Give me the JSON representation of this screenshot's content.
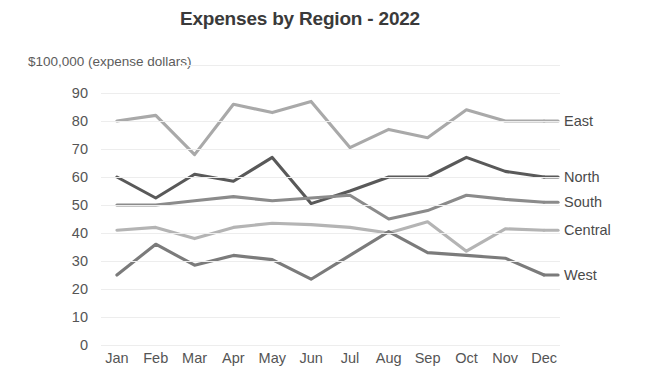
{
  "chart_data": {
    "type": "line",
    "title": "Expenses by Region - 2022",
    "ylabel": "$100,000 (expense dollars)",
    "xlabel": "",
    "categories": [
      "Jan",
      "Feb",
      "Mar",
      "Apr",
      "May",
      "Jun",
      "Jul",
      "Aug",
      "Sep",
      "Oct",
      "Nov",
      "Dec"
    ],
    "ylim": [
      0,
      90
    ],
    "yticks": [
      90,
      80,
      70,
      60,
      50,
      40,
      30,
      20,
      10,
      0
    ],
    "grid": true,
    "legend": "right-inline",
    "series": [
      {
        "name": "East",
        "color": "#a9a9a9",
        "values": [
          80,
          82,
          68,
          86,
          83,
          87,
          70.5,
          77,
          74,
          84,
          80,
          80
        ]
      },
      {
        "name": "North",
        "color": "#595959",
        "values": [
          60,
          52.5,
          61,
          58.5,
          67,
          50.5,
          55,
          60,
          60,
          67,
          62,
          60
        ]
      },
      {
        "name": "South",
        "color": "#8b8b8b",
        "values": [
          50,
          50,
          51.5,
          53,
          51.5,
          52.5,
          53.5,
          45,
          48,
          53.5,
          52,
          51
        ]
      },
      {
        "name": "Central",
        "color": "#b4b4b4",
        "values": [
          41,
          42,
          38,
          42,
          43.5,
          43,
          42,
          40,
          44,
          33.5,
          41.5,
          41
        ]
      },
      {
        "name": "West",
        "color": "#7b7b7b",
        "values": [
          25,
          36,
          28.5,
          32,
          30.5,
          23.5,
          32,
          40.5,
          33,
          32,
          31,
          25
        ]
      }
    ]
  }
}
